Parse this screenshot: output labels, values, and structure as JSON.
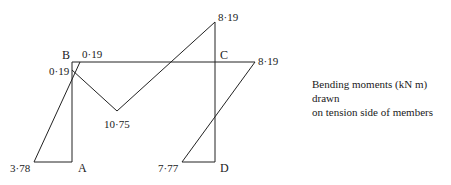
{
  "diagram": {
    "type": "bending-moment-diagram",
    "nodes": {
      "A": "A",
      "B": "B",
      "C": "C",
      "D": "D"
    },
    "moment_labels": {
      "b_top": "0·19",
      "b_left": "0·19",
      "c_top": "8·19",
      "c_right": "8·19",
      "span_mid": "10·75",
      "a_base": "3·78",
      "d_base": "7·77"
    },
    "values_kNm": {
      "M_A": 3.78,
      "M_B_column": 0.19,
      "M_B_beam": 0.19,
      "M_span_max": 10.75,
      "M_C_beam": 8.19,
      "M_C_column": 8.19,
      "M_D": 7.77
    },
    "caption": {
      "line1": "Bending moments (kN m) drawn",
      "line2": "on tension side of members"
    },
    "line_color": "#222222"
  }
}
